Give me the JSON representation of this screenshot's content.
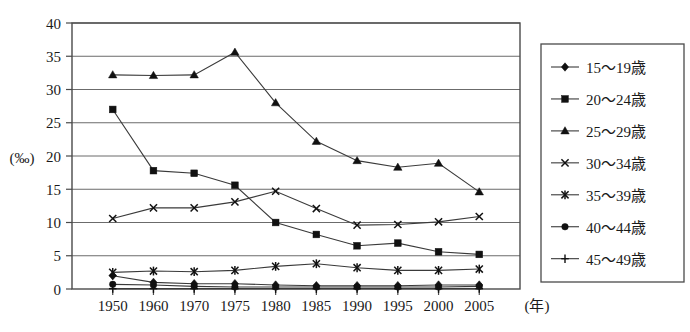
{
  "chart_data": {
    "type": "line",
    "title": "",
    "xlabel": "(年)",
    "ylabel": "(‰)",
    "x": [
      1950,
      1960,
      1970,
      1975,
      1980,
      1985,
      1990,
      1995,
      2000,
      2005
    ],
    "categories": [
      "1950",
      "1960",
      "1970",
      "1975",
      "1980",
      "1985",
      "1990",
      "1995",
      "2000",
      "2005"
    ],
    "ylim": [
      0,
      40
    ],
    "yticks": [
      0,
      5,
      10,
      15,
      20,
      25,
      30,
      35,
      40
    ],
    "ytick_labels": [
      "0",
      "5",
      "10",
      "15",
      "20",
      "25",
      "30",
      "35",
      "40"
    ],
    "grid": "horizontal",
    "legend_position": "right",
    "series": [
      {
        "name": "15〜19歳",
        "marker": "diamond",
        "values": [
          2.0,
          1.0,
          0.8,
          0.8,
          0.6,
          0.5,
          0.5,
          0.5,
          0.6,
          0.6
        ]
      },
      {
        "name": "20〜24歳",
        "marker": "square",
        "values": [
          27.0,
          17.8,
          17.4,
          15.6,
          10.0,
          8.2,
          6.5,
          6.9,
          5.6,
          5.2
        ]
      },
      {
        "name": "25〜29歳",
        "marker": "triangle",
        "values": [
          32.2,
          32.1,
          32.2,
          35.6,
          28.0,
          22.2,
          19.3,
          18.3,
          18.9,
          14.6
        ]
      },
      {
        "name": "30〜34歳",
        "marker": "cross",
        "values": [
          10.6,
          12.2,
          12.2,
          13.1,
          14.7,
          12.1,
          9.6,
          9.7,
          10.1,
          10.9
        ]
      },
      {
        "name": "35〜39歳",
        "marker": "star",
        "values": [
          2.5,
          2.7,
          2.6,
          2.8,
          3.4,
          3.8,
          3.2,
          2.8,
          2.8,
          3.0
        ]
      },
      {
        "name": "40〜44歳",
        "marker": "circle",
        "values": [
          0.7,
          0.6,
          0.4,
          0.3,
          0.3,
          0.3,
          0.3,
          0.3,
          0.3,
          0.4
        ]
      },
      {
        "name": "45〜49歳",
        "marker": "plus",
        "values": [
          0.05,
          0.05,
          0.05,
          0.05,
          0.05,
          0.05,
          0.05,
          0.05,
          0.05,
          0.05
        ]
      }
    ]
  },
  "axis": {
    "y_unit": "(‰)",
    "x_unit": "(年)"
  },
  "legend": {
    "items": [
      {
        "label": "15〜19歳",
        "marker": "diamond"
      },
      {
        "label": "20〜24歳",
        "marker": "square"
      },
      {
        "label": "25〜29歳",
        "marker": "triangle"
      },
      {
        "label": "30〜34歳",
        "marker": "cross"
      },
      {
        "label": "35〜39歳",
        "marker": "star"
      },
      {
        "label": "40〜44歳",
        "marker": "circle"
      },
      {
        "label": "45〜49歳",
        "marker": "plus"
      }
    ]
  },
  "colors": {
    "line": "#3a3a3a",
    "marker": "#111111",
    "grid": "#6b6b6b",
    "frame": "#4a4a4a",
    "background": "#ffffff"
  }
}
